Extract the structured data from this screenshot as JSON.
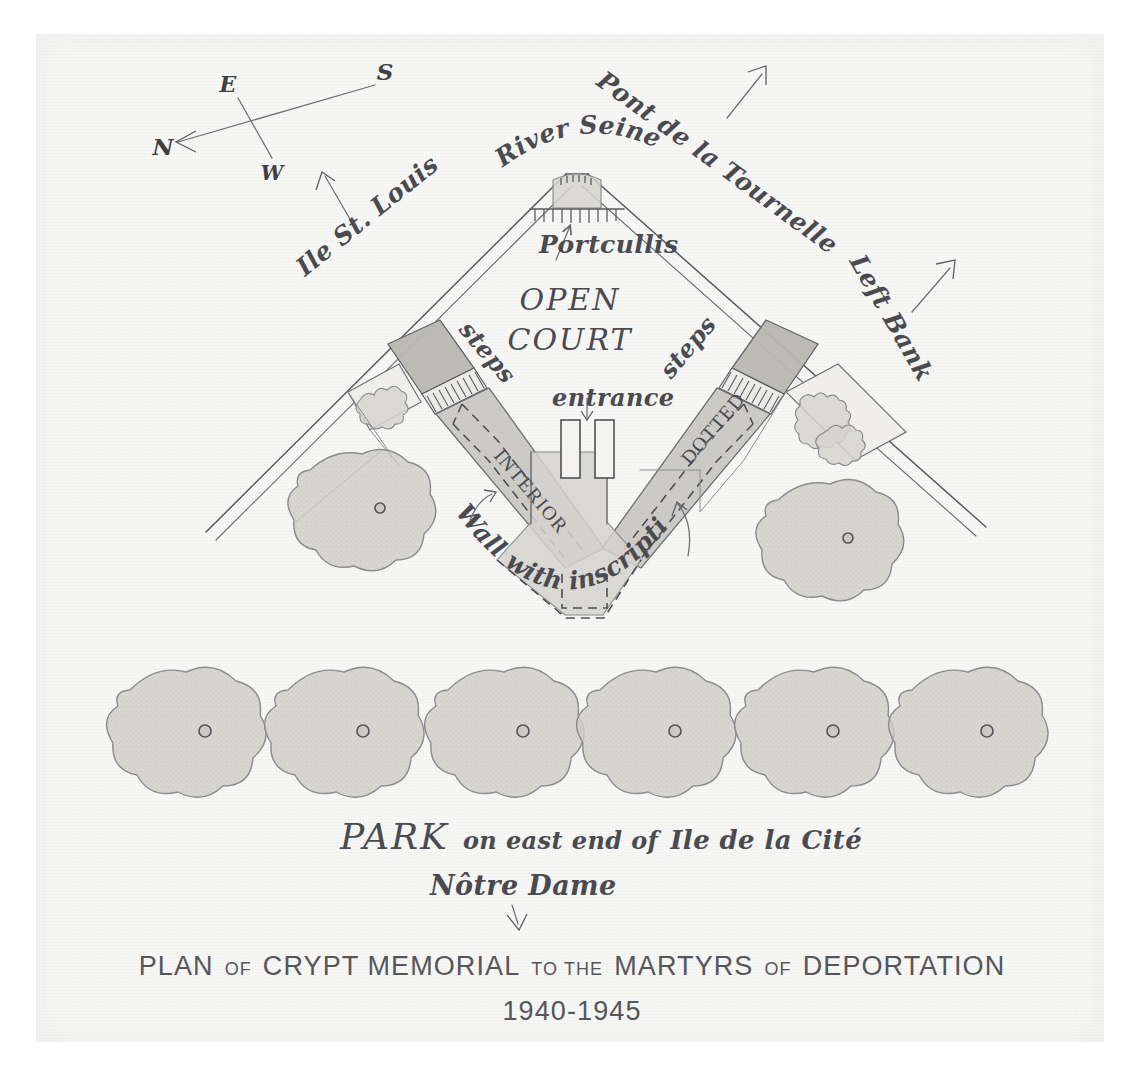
{
  "document": {
    "kind": "hand-drawn architectural site plan",
    "medium": "pencil and ink on paper"
  },
  "title_block": {
    "line1": "PLAN OF CRYPT MEMORIAL TO THE MARTYRS OF DEPORTATION",
    "line1_parts": [
      {
        "text": "PLAN",
        "style": "large"
      },
      {
        "text": "OF",
        "style": "small"
      },
      {
        "text": "CRYPT MEMORIAL",
        "style": "large"
      },
      {
        "text": "TO THE",
        "style": "small"
      },
      {
        "text": "MARTYRS",
        "style": "large"
      },
      {
        "text": "OF",
        "style": "small"
      },
      {
        "text": "DEPORTATION",
        "style": "large"
      }
    ],
    "line2": "1940-1945"
  },
  "compass": {
    "north_label": "N",
    "south_label": "S",
    "east_label": "E",
    "west_label": "W",
    "note": "north arrow points toward lower-left"
  },
  "context_labels": [
    {
      "id": "ile-st-louis",
      "text": "Ile St. Louis",
      "has_arrow": true
    },
    {
      "id": "river-seine",
      "text": "River Seine",
      "has_arrow": false
    },
    {
      "id": "pont-de-la-tournelle",
      "text": "Pont de la Tournelle",
      "has_arrow": true
    },
    {
      "id": "left-bank",
      "text": "Left Bank",
      "has_arrow": true
    },
    {
      "id": "notre-dame",
      "text": "Nôtre Dame",
      "has_arrow": true
    }
  ],
  "plan_labels": [
    {
      "id": "portcullis",
      "text": "Portcullis",
      "has_arrow": true
    },
    {
      "id": "open-court-line1",
      "text": "OPEN"
    },
    {
      "id": "open-court-line2",
      "text": "COURT"
    },
    {
      "id": "steps-left",
      "text": "steps"
    },
    {
      "id": "steps-right",
      "text": "steps"
    },
    {
      "id": "entrance",
      "text": "entrance",
      "has_arrow": true
    },
    {
      "id": "interior",
      "text": "INTERIOR"
    },
    {
      "id": "dotted",
      "text": "DOTTED"
    },
    {
      "id": "wall-with-inscription",
      "text": "Wall with inscription",
      "has_arrow": true,
      "arrow_count": 2
    }
  ],
  "park_caption": {
    "word_large": "PARK",
    "word_rest": "on east end of",
    "place": "Ile de la Cité",
    "full": "PARK on east end of Ile de la Cité"
  },
  "park": {
    "tree_row_count": 6,
    "upper_tree_count": 2,
    "total_trees": 8
  },
  "colors": {
    "paper": "#f7f7f5",
    "ink": "#4a4b50",
    "pencil_shading_dark": "#b9b7b2",
    "pencil_shading_mid": "#c9c7c2",
    "pencil_shading_light": "#d6d4cf",
    "tree_fill": "#cfcdc7",
    "scan_margin": "#ffffff"
  }
}
